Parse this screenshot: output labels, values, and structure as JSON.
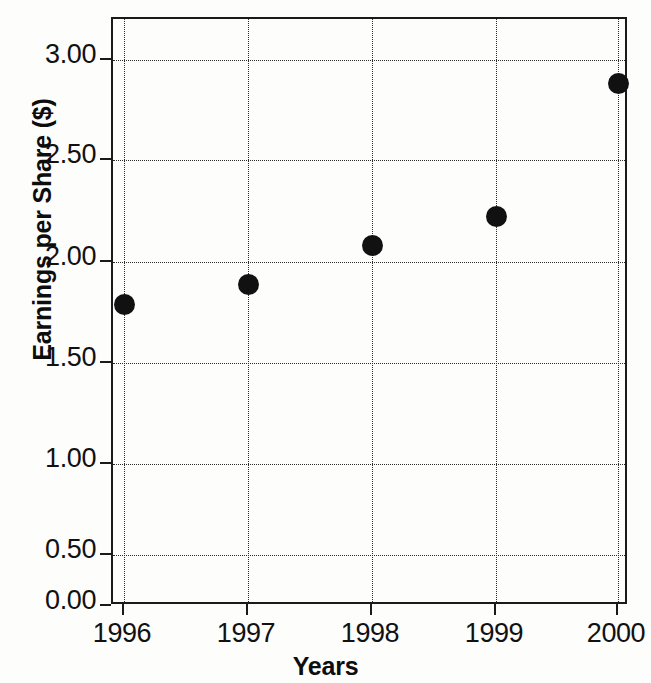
{
  "chart_data": {
    "type": "scatter",
    "title": "",
    "xlabel": "Years",
    "ylabel": "Earnings per Share ($)",
    "categories": [
      "1996",
      "1997",
      "1998",
      "1999",
      "2000"
    ],
    "x": [
      1996,
      1997,
      1998,
      1999,
      2000
    ],
    "values": [
      1.78,
      1.89,
      2.08,
      2.23,
      2.9
    ],
    "series": [
      {
        "name": "Earnings per Share",
        "values": [
          1.78,
          1.89,
          2.08,
          2.23,
          2.9
        ]
      }
    ],
    "ylim": [
      0.0,
      3.2
    ],
    "xlim": [
      1995.8,
      2000.1
    ],
    "ytick_labels": [
      "3.00",
      "2.50",
      "2.00",
      "1.50",
      "1.00",
      "0.50",
      "0.00"
    ],
    "ytick_values": [
      3.0,
      2.5,
      2.0,
      1.5,
      1.0,
      0.5,
      0.0
    ],
    "xtick_labels": [
      "1996",
      "1997",
      "1998",
      "1999",
      "2000"
    ],
    "grid": "both-dotted",
    "legend": "none",
    "marker": "filled-circle",
    "marker_color": "#111111",
    "axis_color": "#1a1a1a",
    "background": "#fdfdfc"
  },
  "axes": {
    "y_title": "Earnings per Share ($)",
    "x_title": "Years",
    "y_ticks": [
      {
        "label": "3.00",
        "y": 58
      },
      {
        "label": "2.50",
        "y": 158
      },
      {
        "label": "2.00",
        "y": 260
      },
      {
        "label": "1.50",
        "y": 361
      },
      {
        "label": "1.00",
        "y": 462
      },
      {
        "label": "0.50",
        "y": 553
      },
      {
        "label": "0.00",
        "y": 604
      }
    ],
    "x_ticks": [
      {
        "label": "1996",
        "x": 122
      },
      {
        "label": "1997",
        "x": 246
      },
      {
        "label": "1998",
        "x": 370
      },
      {
        "label": "1999",
        "x": 494
      },
      {
        "label": "2000",
        "x": 616
      }
    ]
  },
  "points": [
    {
      "label": "1996",
      "value": "1.78",
      "x": 122,
      "y": 302
    },
    {
      "label": "1997",
      "value": "1.89",
      "x": 246,
      "y": 282
    },
    {
      "label": "1998",
      "value": "2.08",
      "x": 370,
      "y": 243
    },
    {
      "label": "1999",
      "value": "2.23",
      "x": 494,
      "y": 214
    },
    {
      "label": "2000",
      "value": "2.90",
      "x": 616,
      "y": 81
    }
  ]
}
